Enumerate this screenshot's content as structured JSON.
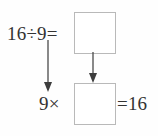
{
  "diagram": {
    "background_color": "#fefefe",
    "line_color": "#4a4a4a",
    "box_border_color": "#b9b9b9",
    "text_color": "#333333",
    "expressions": {
      "division": "16÷9=",
      "multiplier": "9×",
      "product": "=16"
    },
    "boxes": [
      {
        "name": "quotient",
        "value": ""
      },
      {
        "name": "factor",
        "value": ""
      }
    ],
    "arrows": [
      {
        "name": "division-to-multiplication",
        "direction": "down"
      },
      {
        "name": "quotient-to-factor",
        "direction": "down"
      }
    ]
  }
}
